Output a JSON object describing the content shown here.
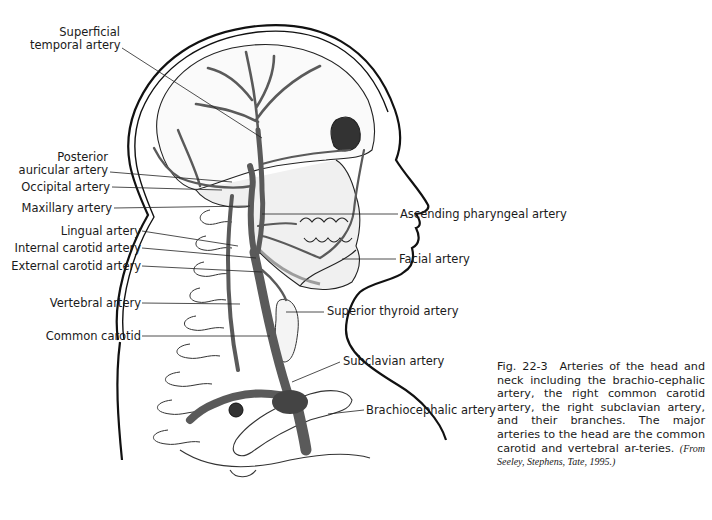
{
  "figure": {
    "id": "Fig. 22-3",
    "caption_text": "Arteries of the head and neck including the brachio-cephalic artery, the right common carotid artery, the right subclavian artery, and their branches. The major arteries to the head are the common carotid and vertebral ar-teries.",
    "source": "(From Seeley, Stephens, Tate, 1995.)",
    "artery_color": "#5a5a5a",
    "outline_color": "#111111"
  },
  "labels": {
    "left": [
      {
        "line1": "Superficial",
        "line2": "temporal artery"
      },
      {
        "line1": "Posterior",
        "line2": "auricular artery"
      },
      {
        "text": "Occipital artery"
      },
      {
        "text": "Maxillary artery"
      },
      {
        "text": "Lingual artery"
      },
      {
        "text": "Internal carotid artery"
      },
      {
        "text": "External carotid artery"
      },
      {
        "text": "Vertebral artery"
      },
      {
        "text": "Common carotid"
      }
    ],
    "right": [
      {
        "text": "Ascending pharyngeal artery"
      },
      {
        "text": "Facial artery"
      },
      {
        "text": "Superior thyroid artery"
      },
      {
        "text": "Subclavian artery"
      },
      {
        "text": "Brachiocephalic artery"
      }
    ]
  }
}
